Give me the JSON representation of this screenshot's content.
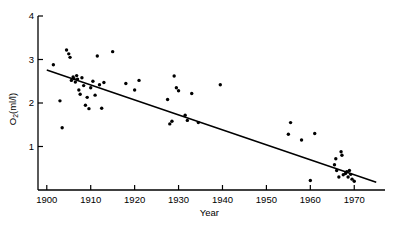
{
  "chart_data": {
    "type": "scatter",
    "title": "",
    "xlabel": "Year",
    "ylabel": "O2(ml/l)",
    "ylabel_base": "O",
    "ylabel_sub": "2",
    "ylabel_rest": "(ml/l)",
    "xlim": [
      1898,
      1977
    ],
    "ylim": [
      0,
      4
    ],
    "grid": false,
    "legend": null,
    "xticks": [
      1900,
      1910,
      1920,
      1930,
      1940,
      1950,
      1960,
      1970
    ],
    "xtick_labels": [
      "1900",
      "1910",
      "1920",
      "1930",
      "1940",
      "1950",
      "1960",
      "1970"
    ],
    "yticks": [
      1,
      2,
      3,
      4
    ],
    "ytick_labels": [
      "1",
      "2",
      "3",
      "4"
    ],
    "series": [
      {
        "name": "O2 measurements",
        "marker": "filled-circle",
        "color": "#000000",
        "points": [
          [
            1901.5,
            2.88
          ],
          [
            1903.0,
            2.05
          ],
          [
            1903.5,
            1.43
          ],
          [
            1904.5,
            3.22
          ],
          [
            1905.0,
            3.13
          ],
          [
            1905.3,
            3.05
          ],
          [
            1905.6,
            2.52
          ],
          [
            1906.0,
            2.6
          ],
          [
            1906.2,
            2.56
          ],
          [
            1906.5,
            2.48
          ],
          [
            1906.8,
            2.63
          ],
          [
            1907.0,
            2.55
          ],
          [
            1907.3,
            2.3
          ],
          [
            1907.6,
            2.2
          ],
          [
            1908.0,
            2.58
          ],
          [
            1908.4,
            2.4
          ],
          [
            1908.8,
            1.95
          ],
          [
            1909.2,
            2.13
          ],
          [
            1909.6,
            1.87
          ],
          [
            1910.0,
            2.35
          ],
          [
            1910.5,
            2.5
          ],
          [
            1911.0,
            2.18
          ],
          [
            1911.5,
            3.08
          ],
          [
            1912.0,
            2.42
          ],
          [
            1912.5,
            1.88
          ],
          [
            1913.0,
            2.47
          ],
          [
            1915.0,
            3.18
          ],
          [
            1918.0,
            2.45
          ],
          [
            1920.0,
            2.3
          ],
          [
            1921.0,
            2.52
          ],
          [
            1927.5,
            2.08
          ],
          [
            1928.0,
            1.52
          ],
          [
            1928.5,
            1.58
          ],
          [
            1929.0,
            2.62
          ],
          [
            1929.5,
            2.35
          ],
          [
            1930.0,
            2.28
          ],
          [
            1931.5,
            1.72
          ],
          [
            1932.0,
            1.6
          ],
          [
            1933.0,
            2.22
          ],
          [
            1934.5,
            1.55
          ],
          [
            1939.5,
            2.42
          ],
          [
            1955.0,
            1.28
          ],
          [
            1955.5,
            1.55
          ],
          [
            1958.0,
            1.15
          ],
          [
            1960.0,
            0.22
          ],
          [
            1961.0,
            1.3
          ],
          [
            1965.5,
            0.58
          ],
          [
            1965.8,
            0.72
          ],
          [
            1966.0,
            0.45
          ],
          [
            1966.5,
            0.3
          ],
          [
            1967.0,
            0.88
          ],
          [
            1967.2,
            0.8
          ],
          [
            1967.5,
            0.35
          ],
          [
            1968.0,
            0.38
          ],
          [
            1968.3,
            0.42
          ],
          [
            1968.6,
            0.3
          ],
          [
            1968.9,
            0.45
          ],
          [
            1969.2,
            0.36
          ],
          [
            1969.5,
            0.25
          ],
          [
            1970.0,
            0.2
          ]
        ]
      }
    ],
    "trendline": {
      "name": "linear fit",
      "color": "#000000",
      "x_start": 1900,
      "y_start": 2.76,
      "x_end": 1975,
      "y_end": 0.18
    }
  }
}
